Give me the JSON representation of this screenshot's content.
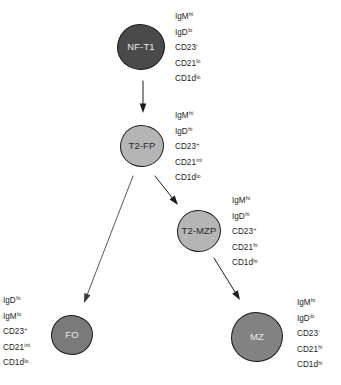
{
  "diagram": {
    "background_color": "#ffffff",
    "nodes": [
      {
        "id": "nf-t1",
        "label": "NF-T1",
        "fill": "#4a4a4a",
        "stroke": "#1a1a1a",
        "text_color": "#e8e8e8",
        "cx": 141,
        "cy": 47,
        "rx": 24,
        "ry": 23,
        "markers": [
          {
            "base": "IgM",
            "sup": "hi"
          },
          {
            "base": "IgD",
            "sup": "lo"
          },
          {
            "base": "CD23",
            "sup": "-"
          },
          {
            "base": "CD21",
            "sup": "lo"
          },
          {
            "base": "CD1d",
            "sup": "lo"
          }
        ],
        "marker_x": 175,
        "marker_y": 12,
        "marker_align": "left"
      },
      {
        "id": "t2-fp",
        "label": "T2-FP",
        "fill": "#b5b5b5",
        "stroke": "#1a1a1a",
        "text_color": "#2b2b2b",
        "cx": 142,
        "cy": 146,
        "rx": 22,
        "ry": 21,
        "markers": [
          {
            "base": "IgM",
            "sup": "hi"
          },
          {
            "base": "IgD",
            "sup": "hi"
          },
          {
            "base": "CD23",
            "sup": "+"
          },
          {
            "base": "CD21",
            "sup": "int"
          },
          {
            "base": "CD1d",
            "sup": "lo"
          }
        ],
        "marker_x": 175,
        "marker_y": 111,
        "marker_align": "left"
      },
      {
        "id": "t2-mzp",
        "label": "T2-MZP",
        "fill": "#b5b5b5",
        "stroke": "#1a1a1a",
        "text_color": "#2b2b2b",
        "cx": 199,
        "cy": 231,
        "rx": 22,
        "ry": 21,
        "markers": [
          {
            "base": "IgM",
            "sup": "hi"
          },
          {
            "base": "IgD",
            "sup": "hi"
          },
          {
            "base": "CD23",
            "sup": "+"
          },
          {
            "base": "CD21",
            "sup": "hi"
          },
          {
            "base": "CD1d",
            "sup": "hi"
          }
        ],
        "marker_x": 232,
        "marker_y": 196,
        "marker_align": "left"
      },
      {
        "id": "fo",
        "label": "FO",
        "fill": "#7a7a7a",
        "stroke": "#1a1a1a",
        "text_color": "#e8e8e8",
        "cx": 72,
        "cy": 335,
        "rx": 21,
        "ry": 20,
        "markers": [
          {
            "base": "IgD",
            "sup": "hi"
          },
          {
            "base": "IgM",
            "sup": "lo"
          },
          {
            "base": "CD23",
            "sup": "+"
          },
          {
            "base": "CD21",
            "sup": "int"
          },
          {
            "base": "CD1d",
            "sup": "lo"
          }
        ],
        "marker_x": 3,
        "marker_y": 296,
        "marker_align": "left"
      },
      {
        "id": "mz",
        "label": "MZ",
        "fill": "#828282",
        "stroke": "#1a1a1a",
        "text_color": "#e8e8e8",
        "cx": 257,
        "cy": 337,
        "rx": 26,
        "ry": 25,
        "markers": [
          {
            "base": "IgM",
            "sup": "hi"
          },
          {
            "base": "IgD",
            "sup": "lo"
          },
          {
            "base": "CD23",
            "sup": "-"
          },
          {
            "base": "CD21",
            "sup": "hi"
          },
          {
            "base": "CD1d",
            "sup": "hi"
          }
        ],
        "marker_x": 297,
        "marker_y": 298,
        "marker_align": "left"
      }
    ],
    "edges": [
      {
        "id": "nf-t1-to-t2-fp",
        "from": "nf-t1",
        "to": "t2-fp",
        "x1": 143,
        "y1": 81,
        "x2": 143,
        "y2": 113,
        "color": "#1c1c1c",
        "width": 1.0
      },
      {
        "id": "t2-fp-to-t2-mzp",
        "from": "t2-fp",
        "to": "t2-mzp",
        "x1": 155,
        "y1": 176,
        "x2": 178,
        "y2": 205,
        "color": "#1c1c1c",
        "width": 1.0
      },
      {
        "id": "t2-fp-to-fo",
        "from": "t2-fp",
        "to": "fo",
        "x1": 133,
        "y1": 176,
        "x2": 84,
        "y2": 303,
        "color": "#3a3a3a",
        "width": 0.85
      },
      {
        "id": "t2-mzp-to-mz",
        "from": "t2-mzp",
        "to": "mz",
        "x1": 214,
        "y1": 258,
        "x2": 240,
        "y2": 300,
        "color": "#1c1c1c",
        "width": 1.0
      }
    ]
  }
}
